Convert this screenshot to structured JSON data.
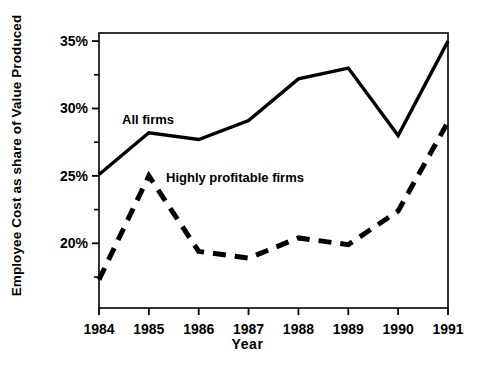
{
  "chart_data": {
    "type": "line",
    "title": "",
    "xlabel": "Year",
    "ylabel": "Employee Cost as share of Value Produced",
    "x": [
      1984,
      1985,
      1986,
      1987,
      1988,
      1989,
      1990,
      1991
    ],
    "categories": [
      "1984",
      "1985",
      "1986",
      "1987",
      "1988",
      "1989",
      "1990",
      "1991"
    ],
    "series": [
      {
        "name": "All firms",
        "style": "solid",
        "values": [
          25.1,
          28.2,
          27.7,
          29.1,
          32.2,
          33.0,
          28.0,
          35.0
        ]
      },
      {
        "name": "Highly profitable firms",
        "style": "dashed",
        "values": [
          17.3,
          25.0,
          19.4,
          18.9,
          20.4,
          19.9,
          22.4,
          29.0
        ]
      }
    ],
    "xlim": [
      1984,
      1991
    ],
    "ylim": [
      15.2,
      35.6
    ],
    "ytick_labels": [
      "35%",
      "30%",
      "25%",
      "20%"
    ],
    "ytick_values": [
      35,
      30,
      25,
      20
    ],
    "yminor_values": [
      32.5,
      27.5,
      22.5,
      17.5
    ],
    "grid": false,
    "legend": "inline-annotations",
    "line_color": "#000000"
  },
  "annotations": {
    "all_firms_label": "All firms",
    "highly_profitable_label": "Highly profitable firms"
  },
  "axis": {
    "x_title": "Year",
    "y_title": "Employee Cost as share of Value Produced"
  }
}
